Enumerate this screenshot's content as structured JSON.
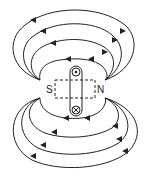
{
  "diagram": {
    "labels": {
      "south": "S",
      "north": "N"
    },
    "symbols": {
      "current_out": "dot (out of page)",
      "current_in": "cross (into page)"
    },
    "colors": {
      "line": "#222222",
      "background": "#ffffff"
    }
  }
}
